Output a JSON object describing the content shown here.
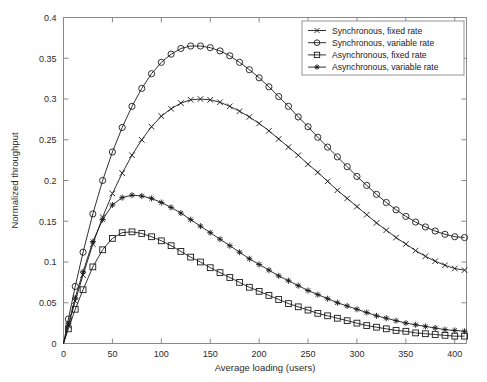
{
  "chart_data": {
    "type": "line",
    "title": "",
    "xlabel": "Average loading (users)",
    "ylabel": "Normalized throughput",
    "xlim": [
      0,
      412
    ],
    "ylim": [
      0,
      0.4
    ],
    "xticks": [
      0,
      50,
      100,
      150,
      200,
      250,
      300,
      350,
      400
    ],
    "xtick_labels": [
      "0",
      "50",
      "100",
      "150",
      "200",
      "250",
      "300",
      "350",
      "400"
    ],
    "yticks": [
      0,
      0.05,
      0.1,
      0.15,
      0.2,
      0.25,
      0.3,
      0.35,
      0.4
    ],
    "ytick_labels": [
      "0",
      "0.05",
      "0.1",
      "0.15",
      "0.2",
      "0.25",
      "0.3",
      "0.35",
      "0.4"
    ],
    "grid": false,
    "legend_position": "top-right",
    "series": [
      {
        "name": "Synchronous, fixed rate",
        "marker": "x",
        "color": "#1a1a1a",
        "x": [
          0,
          5,
          12,
          20,
          30,
          40,
          50,
          60,
          70,
          80,
          90,
          100,
          110,
          120,
          130,
          140,
          150,
          160,
          170,
          180,
          190,
          200,
          210,
          220,
          230,
          240,
          250,
          260,
          270,
          280,
          290,
          300,
          310,
          320,
          330,
          340,
          350,
          360,
          370,
          380,
          390,
          400,
          410
        ],
        "y": [
          0,
          0.022,
          0.052,
          0.084,
          0.122,
          0.155,
          0.184,
          0.209,
          0.231,
          0.25,
          0.266,
          0.279,
          0.288,
          0.295,
          0.299,
          0.3,
          0.299,
          0.296,
          0.291,
          0.285,
          0.278,
          0.27,
          0.261,
          0.251,
          0.241,
          0.231,
          0.22,
          0.21,
          0.199,
          0.188,
          0.178,
          0.168,
          0.158,
          0.148,
          0.139,
          0.13,
          0.122,
          0.114,
          0.107,
          0.101,
          0.096,
          0.092,
          0.09
        ]
      },
      {
        "name": "Synchronous, variable rate",
        "marker": "circle",
        "color": "#1a1a1a",
        "x": [
          0,
          5,
          12,
          20,
          30,
          40,
          50,
          60,
          70,
          80,
          90,
          100,
          110,
          120,
          130,
          140,
          150,
          160,
          170,
          180,
          190,
          200,
          210,
          220,
          230,
          240,
          250,
          260,
          270,
          280,
          290,
          300,
          310,
          320,
          330,
          340,
          350,
          360,
          370,
          380,
          390,
          400,
          410
        ],
        "y": [
          0,
          0.03,
          0.07,
          0.112,
          0.159,
          0.2,
          0.235,
          0.265,
          0.291,
          0.313,
          0.331,
          0.345,
          0.355,
          0.362,
          0.365,
          0.365,
          0.363,
          0.359,
          0.353,
          0.345,
          0.336,
          0.326,
          0.315,
          0.303,
          0.291,
          0.278,
          0.266,
          0.253,
          0.241,
          0.229,
          0.217,
          0.205,
          0.194,
          0.183,
          0.173,
          0.164,
          0.156,
          0.149,
          0.143,
          0.138,
          0.134,
          0.131,
          0.13
        ]
      },
      {
        "name": "Asynchronous, fixed rate",
        "marker": "square",
        "color": "#1a1a1a",
        "x": [
          0,
          5,
          12,
          20,
          30,
          40,
          50,
          60,
          70,
          80,
          90,
          100,
          110,
          120,
          130,
          140,
          150,
          160,
          170,
          180,
          190,
          200,
          210,
          220,
          230,
          240,
          250,
          260,
          270,
          280,
          290,
          300,
          310,
          320,
          330,
          340,
          350,
          360,
          370,
          380,
          390,
          400,
          410
        ],
        "y": [
          0,
          0.018,
          0.042,
          0.066,
          0.094,
          0.115,
          0.129,
          0.136,
          0.137,
          0.135,
          0.131,
          0.126,
          0.12,
          0.113,
          0.106,
          0.1,
          0.093,
          0.087,
          0.081,
          0.075,
          0.069,
          0.064,
          0.059,
          0.054,
          0.049,
          0.045,
          0.041,
          0.037,
          0.034,
          0.031,
          0.028,
          0.025,
          0.022,
          0.02,
          0.018,
          0.016,
          0.015,
          0.013,
          0.012,
          0.011,
          0.01,
          0.009,
          0.009
        ]
      },
      {
        "name": "Asynchronous, variable rate",
        "marker": "star",
        "color": "#1a1a1a",
        "x": [
          0,
          5,
          12,
          20,
          30,
          40,
          50,
          60,
          70,
          80,
          90,
          100,
          110,
          120,
          130,
          140,
          150,
          160,
          170,
          180,
          190,
          200,
          210,
          220,
          230,
          240,
          250,
          260,
          270,
          280,
          290,
          300,
          310,
          320,
          330,
          340,
          350,
          360,
          370,
          380,
          390,
          400,
          410
        ],
        "y": [
          0,
          0.024,
          0.056,
          0.088,
          0.125,
          0.152,
          0.17,
          0.179,
          0.182,
          0.181,
          0.178,
          0.173,
          0.167,
          0.16,
          0.152,
          0.144,
          0.136,
          0.128,
          0.12,
          0.112,
          0.104,
          0.097,
          0.09,
          0.083,
          0.077,
          0.071,
          0.065,
          0.06,
          0.055,
          0.05,
          0.046,
          0.042,
          0.038,
          0.034,
          0.031,
          0.028,
          0.025,
          0.023,
          0.021,
          0.019,
          0.017,
          0.016,
          0.015
        ]
      }
    ]
  },
  "legend": {
    "items": [
      {
        "label": "Synchronous, fixed rate",
        "marker": "x"
      },
      {
        "label": "Synchronous, variable rate",
        "marker": "circle"
      },
      {
        "label": "Asynchronous, fixed rate",
        "marker": "square"
      },
      {
        "label": "Asynchronous, variable rate",
        "marker": "star"
      }
    ]
  }
}
